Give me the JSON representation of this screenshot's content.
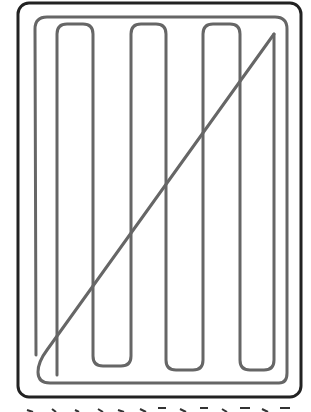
{
  "diagram": {
    "title": "",
    "colors": {
      "background": "#ffffff",
      "frame_stroke": "#222222",
      "path_stroke": "#666666"
    },
    "frame": {
      "x": 18,
      "y": 3,
      "width": 283,
      "height": 394,
      "radius": 11,
      "stroke_width": 3
    },
    "path_description": "Serpentine (boustrophedon) path with 5 up-down passes, a diagonal return from top-right to bottom-left, and a perimeter loop around the area",
    "serpentine_columns_x": [
      57,
      93,
      131,
      166,
      203,
      240,
      274
    ],
    "serpentine_top_y": 24,
    "serpentine_bottom_y": 370,
    "diagonal": {
      "from": [
        274,
        34
      ],
      "to": [
        40,
        362
      ]
    },
    "perimeter_loop": {
      "left": 35,
      "top": 17,
      "right": 287,
      "bottom": 383
    }
  },
  "caption": {
    "visible": "cropped (only top edges of glyphs visible)",
    "glyph_count": 14
  }
}
